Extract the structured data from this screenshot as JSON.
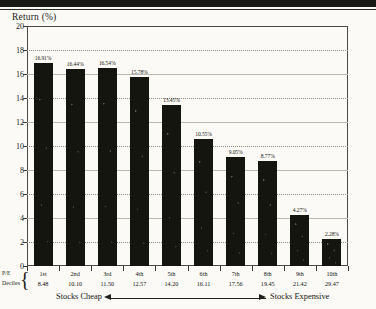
{
  "chart_data": {
    "type": "bar",
    "title": "Return (%)",
    "ylabel": "Return (%)",
    "xlabel": "P/E Deciles",
    "ylim": [
      0,
      20
    ],
    "ytick_step": 2,
    "yticks": [
      "0",
      "2",
      "4",
      "6",
      "8",
      "10",
      "12",
      "14",
      "16",
      "18",
      "20"
    ],
    "grid": true,
    "legend": "none",
    "categories": [
      "1st",
      "2nd",
      "3rd",
      "4th",
      "5th",
      "6th",
      "7th",
      "8th",
      "9th",
      "10th"
    ],
    "values": [
      16.91,
      16.44,
      16.54,
      15.78,
      13.45,
      10.55,
      9.05,
      8.77,
      4.27,
      2.28
    ],
    "value_labels": [
      "16.91%",
      "16.44%",
      "16.54%",
      "15.78%",
      "13.45%",
      "10.55%",
      "9.05%",
      "8.77%",
      "4.27%",
      "2.28%"
    ],
    "pe_ratios": [
      "8.48",
      "10.10",
      "11.50",
      "12.57",
      "14.20",
      "16.11",
      "17.56",
      "19.45",
      "21.42",
      "29.47"
    ],
    "bar_color": "#15150f"
  },
  "axis": {
    "y_title": "Return (%)"
  },
  "table": {
    "row_label_line1": "P/E",
    "row_label_line2": "Deciles",
    "brace": "{"
  },
  "caption": {
    "left": "Stocks Cheap",
    "right": "Stocks Expensive"
  }
}
